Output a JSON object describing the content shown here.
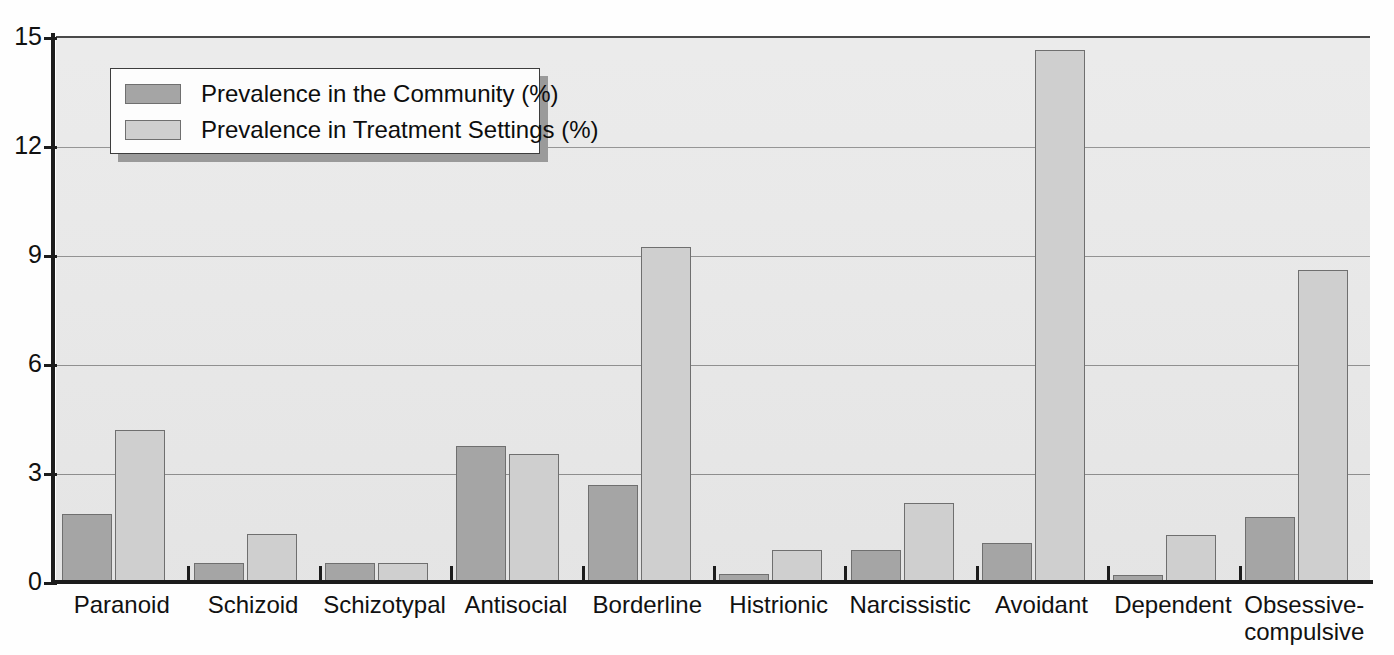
{
  "chart_data": {
    "type": "bar",
    "title": "",
    "xlabel": "",
    "ylabel": "",
    "ylim": [
      0,
      15
    ],
    "yticks": [
      0,
      3,
      6,
      9,
      12,
      15
    ],
    "grid": true,
    "legend_position": "upper-left",
    "categories": [
      "Paranoid",
      "Schizoid",
      "Schizotypal",
      "Antisocial",
      "Borderline",
      "Histrionic",
      "Narcissistic",
      "Avoidant",
      "Dependent",
      "Obsessive-\ncompulsive"
    ],
    "series": [
      {
        "name": "Prevalence in the Community (%)",
        "color": "#a5a5a5",
        "values": [
          1.9,
          0.55,
          0.55,
          3.75,
          2.7,
          0.25,
          0.9,
          1.1,
          0.2,
          1.8
        ]
      },
      {
        "name": "Prevalence in Treatment Settings (%)",
        "color": "#cfcfcf",
        "values": [
          4.2,
          1.35,
          0.55,
          3.55,
          9.25,
          0.9,
          2.2,
          14.65,
          1.3,
          8.6
        ]
      }
    ]
  },
  "legend": {
    "items": [
      {
        "label": "Prevalence in the Community (%)",
        "swatch": "community"
      },
      {
        "label": "Prevalence in Treatment Settings (%)",
        "swatch": "treatment"
      }
    ]
  },
  "axes": {
    "y_tick_labels": [
      "0",
      "3",
      "6",
      "9",
      "12",
      "15"
    ],
    "x_tick_labels": [
      "Paranoid",
      "Schizoid",
      "Schizotypal",
      "Antisocial",
      "Borderline",
      "Histrionic",
      "Narcissistic",
      "Avoidant",
      "Dependent",
      "Obsessive-compulsive"
    ]
  },
  "colors": {
    "plot_background": "#e9e9e9",
    "community_bar": "#a5a5a5",
    "treatment_bar": "#cfcfcf",
    "gridline": "#8d8d8d",
    "axis": "#1c1c1c"
  }
}
